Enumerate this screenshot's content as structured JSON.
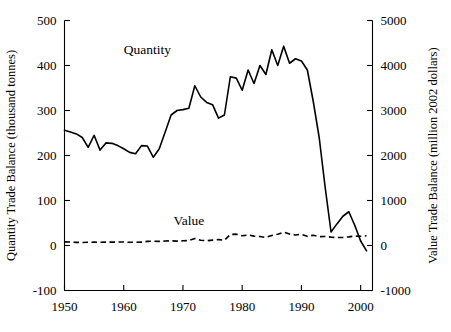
{
  "chart_data": {
    "type": "line",
    "title": "",
    "xlabel": "",
    "ylabel": "Quantity Trade Balance (thousand tonnes)",
    "y2label": "Value Trade Balance (million 2002 dollars)",
    "xlim": [
      1950,
      2002
    ],
    "ylim": [
      -100,
      500
    ],
    "y2lim": [
      -1000,
      5000
    ],
    "grid": false,
    "legend_position": "inline-annotation",
    "xticks": [
      1950,
      1960,
      1970,
      1980,
      1990,
      2000
    ],
    "xtick_labels": [
      "1950",
      "1960",
      "1970",
      "1980",
      "1990",
      "2000"
    ],
    "yticks": [
      -100,
      0,
      100,
      200,
      300,
      400,
      500
    ],
    "ytick_labels": [
      "-100",
      "0",
      "100",
      "200",
      "300",
      "400",
      "500"
    ],
    "y2ticks": [
      -1000,
      0,
      1000,
      2000,
      3000,
      4000,
      5000
    ],
    "y2tick_labels": [
      "-1000",
      "0",
      "1000",
      "2000",
      "3000",
      "4000",
      "5000"
    ],
    "x": [
      1950,
      1951,
      1952,
      1953,
      1954,
      1955,
      1956,
      1957,
      1958,
      1959,
      1960,
      1961,
      1962,
      1963,
      1964,
      1965,
      1966,
      1967,
      1968,
      1969,
      1970,
      1971,
      1972,
      1973,
      1974,
      1975,
      1976,
      1977,
      1978,
      1979,
      1980,
      1981,
      1982,
      1983,
      1984,
      1985,
      1986,
      1987,
      1988,
      1989,
      1990,
      1991,
      1992,
      1993,
      1994,
      1995,
      1996,
      1997,
      1998,
      1999,
      2000,
      2001
    ],
    "series": [
      {
        "name": "Quantity",
        "axis": "left",
        "style": "solid",
        "units": "thousand tonnes",
        "label_point": {
          "x": 1964,
          "y": 425
        },
        "values": [
          256,
          252,
          248,
          240,
          218,
          245,
          212,
          228,
          227,
          222,
          215,
          207,
          204,
          222,
          221,
          196,
          215,
          252,
          290,
          300,
          302,
          305,
          355,
          330,
          318,
          313,
          283,
          290,
          375,
          372,
          345,
          390,
          360,
          400,
          380,
          435,
          400,
          443,
          405,
          415,
          410,
          390,
          320,
          240,
          130,
          30,
          48,
          65,
          75,
          45,
          10,
          -12
        ]
      },
      {
        "name": "Value",
        "axis": "right",
        "style": "dashed",
        "units": "million 2002 dollars",
        "label_point": {
          "x": 1971,
          "y": 45
        },
        "values": [
          80,
          76,
          70,
          68,
          73,
          74,
          71,
          76,
          75,
          76,
          77,
          72,
          70,
          74,
          92,
          96,
          92,
          100,
          104,
          97,
          104,
          109,
          155,
          117,
          105,
          120,
          130,
          115,
          245,
          252,
          215,
          235,
          208,
          200,
          178,
          225,
          250,
          295,
          255,
          235,
          250,
          203,
          228,
          196,
          200,
          186,
          178,
          180,
          192,
          210,
          205,
          215
        ]
      }
    ]
  }
}
